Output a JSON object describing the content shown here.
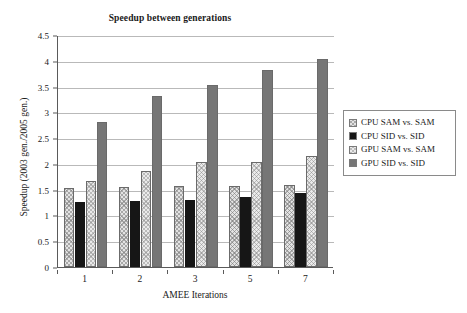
{
  "chart_data": {
    "type": "bar",
    "title": "Speedup between generations",
    "xlabel": "AMEE Iterations",
    "ylabel": "Speedup (2003 gen./2005 gen.)",
    "categories": [
      "1",
      "2",
      "3",
      "5",
      "7"
    ],
    "series": [
      {
        "name": "CPU SAM vs. SAM",
        "values": [
          1.53,
          1.56,
          1.58,
          1.58,
          1.6
        ],
        "color": "#e3e3e3",
        "pattern": "crosshatch"
      },
      {
        "name": "CPU SID vs. SID",
        "values": [
          1.27,
          1.28,
          1.3,
          1.35,
          1.43
        ],
        "color": "#161616",
        "pattern": "solid"
      },
      {
        "name": "GPU SAM vs. SAM",
        "values": [
          1.67,
          1.87,
          2.04,
          2.03,
          2.15
        ],
        "color": "#eaeaea",
        "pattern": "crosshatch"
      },
      {
        "name": "GPU SID vs. SID",
        "values": [
          2.82,
          3.32,
          3.53,
          3.83,
          4.04
        ],
        "color": "#767676",
        "pattern": "solid"
      }
    ],
    "ylim": [
      0,
      4.5
    ],
    "yticks": [
      "0",
      "0.5",
      "1",
      "1.5",
      "2",
      "2.5",
      "3",
      "3.5",
      "4",
      "4.5"
    ],
    "ytick_values": [
      0,
      0.5,
      1,
      1.5,
      2,
      2.5,
      3,
      3.5,
      4,
      4.5
    ],
    "grid": true,
    "legend_position": "right"
  }
}
